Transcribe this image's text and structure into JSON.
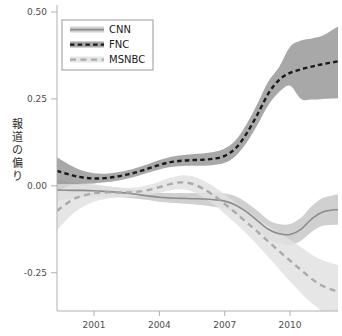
{
  "chart_data": {
    "type": "line",
    "title": "",
    "xlabel": "",
    "ylabel": "報道の偏り",
    "xlim": [
      1999.3,
      2012.2
    ],
    "ylim": [
      -0.36,
      0.52
    ],
    "xticks": [
      2001,
      2004,
      2007,
      2010
    ],
    "xticklabels": [
      "2001",
      "2004",
      "2007",
      "2010"
    ],
    "yticks": [
      0.5,
      0.25,
      0.0,
      -0.25
    ],
    "yticklabels": [
      "0.50",
      "0.25",
      "0.00",
      "-0.25"
    ],
    "grid": false,
    "legend_position": "upper-left",
    "bands": "95% confidence interval shaded around each series",
    "x": [
      1999.3,
      2000,
      2000.5,
      2001,
      2001.5,
      2002,
      2002.5,
      2003,
      2003.5,
      2004,
      2004.5,
      2005,
      2005.5,
      2006,
      2006.5,
      2007,
      2007.5,
      2008,
      2008.5,
      2009,
      2009.5,
      2010,
      2010.5,
      2011,
      2011.5,
      2012.2
    ],
    "series": [
      {
        "name": "CNN",
        "style": "solid",
        "color": "#8c8c8c",
        "band_color": "#c8c8c8",
        "values": [
          -0.012,
          -0.013,
          -0.013,
          -0.014,
          -0.016,
          -0.018,
          -0.021,
          -0.025,
          -0.029,
          -0.033,
          -0.035,
          -0.036,
          -0.037,
          -0.038,
          -0.04,
          -0.044,
          -0.055,
          -0.075,
          -0.1,
          -0.125,
          -0.138,
          -0.14,
          -0.125,
          -0.095,
          -0.075,
          -0.068
        ],
        "band_lower": [
          -0.042,
          -0.036,
          -0.033,
          -0.031,
          -0.031,
          -0.032,
          -0.034,
          -0.037,
          -0.041,
          -0.046,
          -0.049,
          -0.051,
          -0.053,
          -0.056,
          -0.06,
          -0.066,
          -0.08,
          -0.102,
          -0.128,
          -0.152,
          -0.166,
          -0.17,
          -0.158,
          -0.132,
          -0.115,
          -0.112
        ],
        "band_upper": [
          0.018,
          0.01,
          0.007,
          0.003,
          -0.001,
          -0.004,
          -0.008,
          -0.013,
          -0.017,
          -0.02,
          -0.021,
          -0.021,
          -0.021,
          -0.02,
          -0.02,
          -0.022,
          -0.03,
          -0.048,
          -0.072,
          -0.098,
          -0.11,
          -0.11,
          -0.092,
          -0.058,
          -0.035,
          -0.024
        ]
      },
      {
        "name": "FNC",
        "style": "dashed",
        "color": "#1a1a1a",
        "band_color": "#999999",
        "values": [
          0.043,
          0.03,
          0.024,
          0.021,
          0.022,
          0.026,
          0.032,
          0.04,
          0.05,
          0.06,
          0.068,
          0.072,
          0.074,
          0.075,
          0.078,
          0.086,
          0.108,
          0.15,
          0.205,
          0.265,
          0.305,
          0.325,
          0.335,
          0.343,
          0.35,
          0.358
        ],
        "band_lower": [
          0.005,
          0.005,
          0.006,
          0.007,
          0.01,
          0.014,
          0.02,
          0.028,
          0.038,
          0.047,
          0.054,
          0.057,
          0.058,
          0.058,
          0.06,
          0.066,
          0.086,
          0.124,
          0.175,
          0.232,
          0.27,
          0.288,
          0.25,
          0.248,
          0.25,
          0.252
        ],
        "band_upper": [
          0.082,
          0.056,
          0.043,
          0.036,
          0.035,
          0.038,
          0.044,
          0.053,
          0.063,
          0.074,
          0.083,
          0.088,
          0.091,
          0.093,
          0.097,
          0.107,
          0.131,
          0.177,
          0.236,
          0.3,
          0.342,
          0.4,
          0.418,
          0.424,
          0.432,
          0.458
        ]
      },
      {
        "name": "MSNBC",
        "style": "dashed",
        "color": "#aaaaaa",
        "band_color": "#e2e2e2",
        "values": [
          -0.072,
          -0.04,
          -0.028,
          -0.021,
          -0.019,
          -0.019,
          -0.019,
          -0.017,
          -0.012,
          -0.004,
          0.005,
          0.01,
          0.006,
          -0.008,
          -0.028,
          -0.052,
          -0.078,
          -0.105,
          -0.132,
          -0.16,
          -0.188,
          -0.215,
          -0.242,
          -0.268,
          -0.288,
          -0.305
        ],
        "band_lower": [
          -0.128,
          -0.082,
          -0.06,
          -0.046,
          -0.038,
          -0.034,
          -0.032,
          -0.03,
          -0.026,
          -0.02,
          -0.013,
          -0.01,
          -0.016,
          -0.032,
          -0.054,
          -0.08,
          -0.108,
          -0.138,
          -0.17,
          -0.205,
          -0.24,
          -0.275,
          -0.308,
          -0.338,
          -0.362,
          -0.382
        ],
        "band_upper": [
          -0.016,
          0.002,
          0.004,
          0.004,
          0.0,
          -0.004,
          -0.006,
          -0.004,
          0.002,
          0.012,
          0.023,
          0.03,
          0.028,
          0.016,
          -0.002,
          -0.024,
          -0.048,
          -0.072,
          -0.094,
          -0.115,
          -0.136,
          -0.155,
          -0.176,
          -0.198,
          -0.214,
          -0.228
        ]
      }
    ]
  },
  "legend": {
    "items": [
      {
        "label": "CNN",
        "style": "solid"
      },
      {
        "label": "FNC",
        "style": "dashed"
      },
      {
        "label": "MSNBC",
        "style": "dashed"
      }
    ]
  },
  "axes": {
    "y_title_chars": [
      "報",
      "道",
      "の",
      "偏",
      "り"
    ]
  },
  "colors": {
    "cnn_line": "#8c8c8c",
    "cnn_band": "#c8c8c8",
    "fnc_line": "#1a1a1a",
    "fnc_band": "#999999",
    "msnbc_line": "#aaaaaa",
    "msnbc_band": "#e2e2e2",
    "axis": "#b0b0b0",
    "text": "#4d4d4d"
  }
}
